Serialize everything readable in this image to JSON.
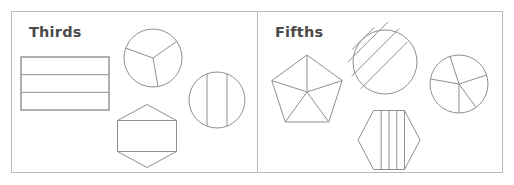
{
  "figure": {
    "width": 514,
    "height": 185,
    "background_color": "#ffffff",
    "panel_border_color": "#b9bcbe",
    "shape_stroke_color": "#8c9093",
    "title_color": "#4a4a4a"
  },
  "panels": [
    {
      "id": "thirds",
      "title": "Thirds",
      "denominator": 3,
      "shapes": [
        {
          "name": "rectangle-thirds",
          "type": "rectangle",
          "parts": 3,
          "partition": "horizontal-bands",
          "x": 21,
          "y": 57,
          "width": 88,
          "height": 53
        },
        {
          "name": "circle-thirds-sectors",
          "type": "circle",
          "parts": 3,
          "partition": "radial-sectors",
          "cx": 153,
          "cy": 58,
          "r": 29,
          "sector_angles_deg": [
            160,
            35,
            280
          ]
        },
        {
          "name": "circle-thirds-vertical-strips",
          "type": "circle",
          "parts": 3,
          "partition": "vertical-chords",
          "cx": 217,
          "cy": 100,
          "r": 28,
          "chord_offsets": [
            -10,
            10
          ]
        },
        {
          "name": "hexagon-thirds",
          "type": "hexagon",
          "parts": 3,
          "partition": "horizontal-bands",
          "cx": 147,
          "cy": 136,
          "width": 59,
          "height": 63
        }
      ]
    },
    {
      "id": "fifths",
      "title": "Fifths",
      "denominator": 5,
      "shapes": [
        {
          "name": "pentagon-fifths",
          "type": "pentagon",
          "parts": 5,
          "partition": "radial-triangles",
          "cx": 307,
          "cy": 92,
          "r": 37
        },
        {
          "name": "circle-fifths-diagonal-strips",
          "type": "circle",
          "parts": 5,
          "partition": "diagonal-chords",
          "cx": 385,
          "cy": 62,
          "r": 32,
          "chord_count": 4,
          "chord_angle_deg": 45
        },
        {
          "name": "circle-fifths-sectors",
          "type": "circle",
          "parts": 5,
          "partition": "radial-sectors",
          "cx": 459,
          "cy": 84,
          "r": 29,
          "sector_angles_deg": [
            72,
            144,
            216,
            288,
            0
          ]
        },
        {
          "name": "hexagon-fifths-vertical-strips",
          "type": "hexagon",
          "parts": 5,
          "partition": "vertical-strips",
          "cx": 389,
          "cy": 140,
          "width": 62,
          "height": 59
        }
      ]
    }
  ]
}
